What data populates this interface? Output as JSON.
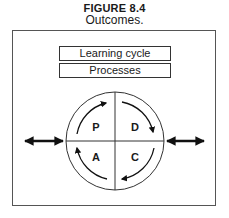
{
  "figure": {
    "number": "FIGURE 8.4",
    "title": "Outcomes."
  },
  "boxes": [
    {
      "label": "Learning cycle"
    },
    {
      "label": "Processes"
    }
  ],
  "cycle": {
    "quadrants": [
      {
        "position": "top-left",
        "label": "P"
      },
      {
        "position": "top-right",
        "label": "D"
      },
      {
        "position": "bottom-right",
        "label": "C"
      },
      {
        "position": "bottom-left",
        "label": "A"
      }
    ],
    "direction": "clockwise"
  },
  "connectors": [
    {
      "side": "left",
      "icon": "double-headed-arrow-icon"
    },
    {
      "side": "right",
      "icon": "double-headed-arrow-icon"
    }
  ],
  "colors": {
    "line": "#333333",
    "arrow": "#111111",
    "background": "#ffffff"
  }
}
